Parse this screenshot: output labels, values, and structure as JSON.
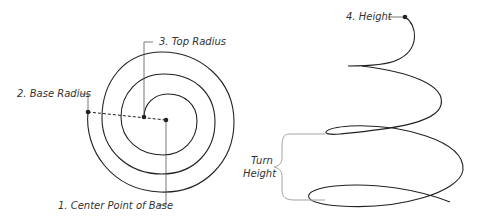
{
  "diagram": {
    "top_view": {
      "labels": {
        "center_point": "1. Center Point of Base",
        "base_radius": "2. Base Radius",
        "top_radius": "3. Top Radius"
      }
    },
    "side_view": {
      "labels": {
        "height": "4. Height",
        "turn_height_line1": "Turn",
        "turn_height_line2": "Height"
      }
    },
    "colors": {
      "curve": "#222222",
      "leader": "#555555",
      "bracket": "#999999"
    }
  }
}
